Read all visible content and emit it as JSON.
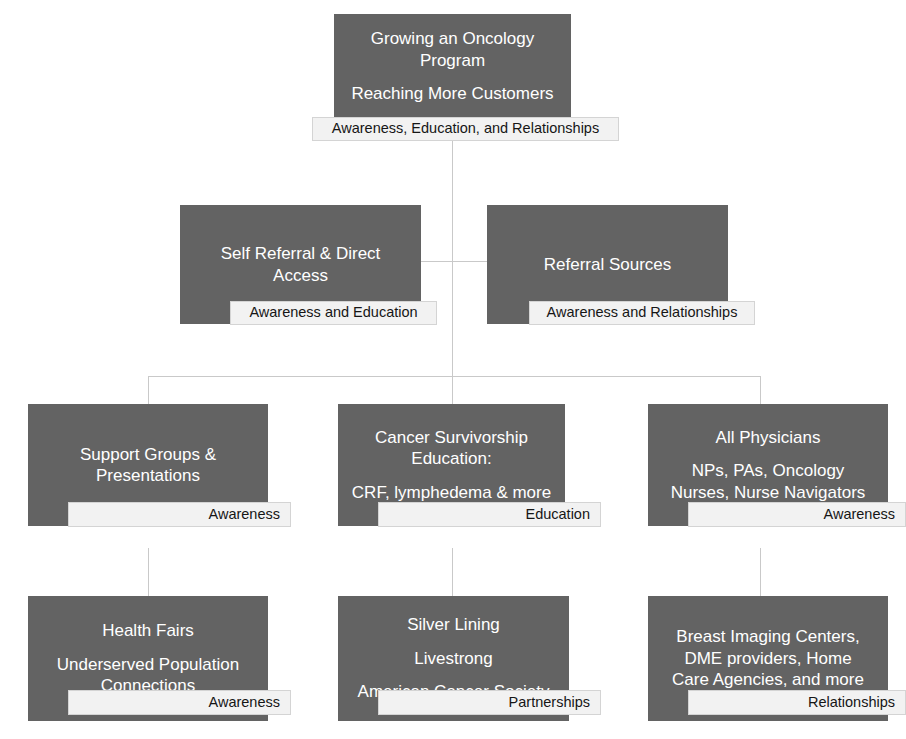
{
  "diagram": {
    "type": "organizational-hierarchy",
    "title": "Growing an Oncology Program",
    "colors": {
      "node_fill": "#636363",
      "node_text": "#ffffff",
      "sublabel_fill": "#f2f2f2",
      "sublabel_border": "#d4d4d4",
      "sublabel_text": "#161616",
      "connector": "#c9c9c9",
      "background": "#ffffff"
    },
    "levels": [
      {
        "level": 1,
        "nodes": [
          {
            "id": "root",
            "lines": [
              "Growing an Oncology",
              "Program",
              "Reaching More Customers"
            ],
            "line_groups": [
              [
                "Growing an Oncology",
                "Program"
              ],
              [
                "Reaching More Customers"
              ]
            ],
            "sublabel": "Awareness, Education, and Relationships",
            "sublabel_align": "center"
          }
        ]
      },
      {
        "level": 2,
        "nodes": [
          {
            "id": "self-referral",
            "lines": [
              "Self Referral & Direct",
              "Access"
            ],
            "line_groups": [
              [
                "Self Referral & Direct",
                "Access"
              ]
            ],
            "sublabel": "Awareness and Education",
            "sublabel_align": "center"
          },
          {
            "id": "referral-sources",
            "lines": [
              "Referral Sources"
            ],
            "line_groups": [
              [
                "Referral Sources"
              ]
            ],
            "sublabel": "Awareness and Relationships",
            "sublabel_align": "center"
          }
        ]
      },
      {
        "level": 3,
        "nodes": [
          {
            "id": "support-groups",
            "lines": [
              "Support Groups &",
              "Presentations"
            ],
            "line_groups": [
              [
                "Support Groups &",
                "Presentations"
              ]
            ],
            "sublabel": "Awareness",
            "sublabel_align": "right"
          },
          {
            "id": "survivorship-education",
            "lines": [
              "Cancer Survivorship",
              "Education:",
              "CRF, lymphedema & more"
            ],
            "line_groups": [
              [
                "Cancer Survivorship",
                "Education:"
              ],
              [
                "CRF, lymphedema & more"
              ]
            ],
            "sublabel": "Education",
            "sublabel_align": "right"
          },
          {
            "id": "all-physicians",
            "lines": [
              "All Physicians",
              "NPs, PAs, Oncology",
              "Nurses, Nurse Navigators"
            ],
            "line_groups": [
              [
                "All Physicians"
              ],
              [
                "NPs, PAs, Oncology",
                "Nurses, Nurse Navigators"
              ]
            ],
            "sublabel": "Awareness",
            "sublabel_align": "right"
          }
        ]
      },
      {
        "level": 4,
        "nodes": [
          {
            "id": "health-fairs",
            "lines": [
              "Health Fairs",
              "Underserved Population",
              "Connections"
            ],
            "line_groups": [
              [
                "Health Fairs"
              ],
              [
                "Underserved Population",
                "Connections"
              ]
            ],
            "sublabel": "Awareness",
            "sublabel_align": "right"
          },
          {
            "id": "partners",
            "lines": [
              "Silver Lining",
              "Livestrong",
              "American Cancer Society"
            ],
            "line_groups": [
              [
                "Silver Lining"
              ],
              [
                "Livestrong"
              ],
              [
                "American Cancer Society"
              ]
            ],
            "sublabel": "Partnerships",
            "sublabel_align": "right"
          },
          {
            "id": "vendors",
            "lines": [
              "Breast Imaging Centers,",
              "DME providers, Home",
              "Care Agencies, and more"
            ],
            "line_groups": [
              [
                "Breast Imaging Centers,",
                "DME providers, Home",
                "Care Agencies, and more"
              ]
            ],
            "sublabel": "Relationships",
            "sublabel_align": "right"
          }
        ]
      }
    ]
  },
  "n1": {
    "l1": "Growing an Oncology",
    "l2": "Program",
    "l3": "Reaching More Customers",
    "sub": "Awareness, Education, and Relationships"
  },
  "n2a": {
    "l1": "Self Referral & Direct",
    "l2": "Access",
    "sub": "Awareness and Education"
  },
  "n2b": {
    "l1": "Referral Sources",
    "sub": "Awareness and Relationships"
  },
  "n3a": {
    "l1": "Support Groups &",
    "l2": "Presentations",
    "sub": "Awareness"
  },
  "n3b": {
    "l1": "Cancer Survivorship",
    "l2": "Education:",
    "l3": "CRF, lymphedema & more",
    "sub": "Education"
  },
  "n3c": {
    "l1": "All Physicians",
    "l2": "NPs, PAs, Oncology",
    "l3": "Nurses, Nurse Navigators",
    "sub": "Awareness"
  },
  "n4a": {
    "l1": "Health Fairs",
    "l2": "Underserved Population",
    "l3": "Connections",
    "sub": "Awareness"
  },
  "n4b": {
    "l1": "Silver Lining",
    "l2": "Livestrong",
    "l3": "American Cancer Society",
    "sub": "Partnerships"
  },
  "n4c": {
    "l1": "Breast Imaging Centers,",
    "l2": "DME providers, Home",
    "l3": "Care Agencies, and more",
    "sub": "Relationships"
  }
}
